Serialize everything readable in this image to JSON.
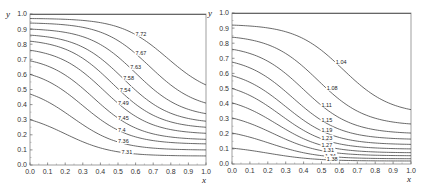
{
  "chart_data": [
    {
      "type": "line",
      "subtype": "contour",
      "title": "",
      "xlabel": "x",
      "ylabel": "y",
      "xlim": [
        0.0,
        1.0
      ],
      "ylim": [
        0.0,
        1.0
      ],
      "xticks": [
        "0.0",
        "0.1",
        "0.2",
        "0.3",
        "0.4",
        "0.5",
        "0.6",
        "0.7",
        "0.8",
        "0.9",
        "1.0"
      ],
      "yticks": [
        "0.0",
        "0.1",
        "0.2",
        "0.3",
        "0.4",
        "0.5",
        "0.6",
        "0.7",
        "0.8",
        "0.9",
        "1.0"
      ],
      "grid": false,
      "series": [
        {
          "name": "7.72",
          "y_at_x0": 0.97,
          "y_at_x1": 0.53,
          "mid_x": 0.78,
          "label_x": 0.6
        },
        {
          "name": "7.67",
          "y_at_x0": 0.94,
          "y_at_x1": 0.41,
          "mid_x": 0.68,
          "label_x": 0.6
        },
        {
          "name": "7.63",
          "y_at_x0": 0.9,
          "y_at_x1": 0.34,
          "mid_x": 0.6,
          "label_x": 0.57
        },
        {
          "name": "7.58",
          "y_at_x0": 0.86,
          "y_at_x1": 0.29,
          "mid_x": 0.53,
          "label_x": 0.53
        },
        {
          "name": "7.54",
          "y_at_x0": 0.82,
          "y_at_x1": 0.25,
          "mid_x": 0.47,
          "label_x": 0.51
        },
        {
          "name": "7.49",
          "y_at_x0": 0.76,
          "y_at_x1": 0.21,
          "mid_x": 0.42,
          "label_x": 0.5
        },
        {
          "name": "7.45",
          "y_at_x0": 0.69,
          "y_at_x1": 0.17,
          "mid_x": 0.36,
          "label_x": 0.5
        },
        {
          "name": "7.4",
          "y_at_x0": 0.6,
          "y_at_x1": 0.14,
          "mid_x": 0.3,
          "label_x": 0.5
        },
        {
          "name": "7.36",
          "y_at_x0": 0.47,
          "y_at_x1": 0.1,
          "mid_x": 0.24,
          "label_x": 0.5
        },
        {
          "name": "7.31",
          "y_at_x0": 0.3,
          "y_at_x1": 0.06,
          "mid_x": 0.2,
          "label_x": 0.52
        }
      ]
    },
    {
      "type": "line",
      "subtype": "contour",
      "title": "",
      "xlabel": "x",
      "ylabel": "y",
      "xlim": [
        0.0,
        1.0
      ],
      "ylim": [
        0.0,
        1.0
      ],
      "xticks": [
        "0.0",
        "0.1",
        "0.2",
        "0.3",
        "0.4",
        "0.5",
        "0.6",
        "0.7",
        "0.8",
        "0.9",
        "1.0"
      ],
      "yticks": [
        "0.0",
        "0.1",
        "0.2",
        "0.3",
        "0.4",
        "0.5",
        "0.6",
        "0.7",
        "0.8",
        "0.9",
        "1.0"
      ],
      "grid": false,
      "series": [
        {
          "name": "1.04",
          "y_at_x0": 0.92,
          "y_at_x1": 0.36,
          "mid_x": 0.62,
          "label_x": 0.58
        },
        {
          "name": "1.08",
          "y_at_x0": 0.84,
          "y_at_x1": 0.265,
          "mid_x": 0.48,
          "label_x": 0.53
        },
        {
          "name": "1.11",
          "y_at_x0": 0.76,
          "y_at_x1": 0.205,
          "mid_x": 0.4,
          "label_x": 0.5
        },
        {
          "name": "1.15",
          "y_at_x0": 0.675,
          "y_at_x1": 0.165,
          "mid_x": 0.34,
          "label_x": 0.5
        },
        {
          "name": "1.19",
          "y_at_x0": 0.585,
          "y_at_x1": 0.13,
          "mid_x": 0.3,
          "label_x": 0.5
        },
        {
          "name": "1.23",
          "y_at_x0": 0.5,
          "y_at_x1": 0.1,
          "mid_x": 0.27,
          "label_x": 0.5
        },
        {
          "name": "1.27",
          "y_at_x0": 0.405,
          "y_at_x1": 0.075,
          "mid_x": 0.25,
          "label_x": 0.5
        },
        {
          "name": "1.31",
          "y_at_x0": 0.305,
          "y_at_x1": 0.055,
          "mid_x": 0.23,
          "label_x": 0.51
        },
        {
          "name": "1.34",
          "y_at_x0": 0.205,
          "y_at_x1": 0.035,
          "mid_x": 0.21,
          "label_x": 0.52
        },
        {
          "name": "1.38",
          "y_at_x0": 0.105,
          "y_at_x1": 0.02,
          "mid_x": 0.2,
          "label_x": 0.53
        }
      ]
    }
  ]
}
